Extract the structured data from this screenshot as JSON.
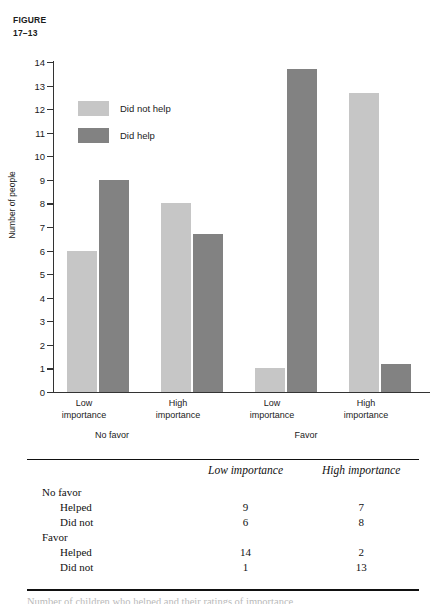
{
  "figure": {
    "label_line1": "FIGURE",
    "label_line2": "17–13"
  },
  "chart_data": {
    "type": "bar",
    "title": "",
    "xlabel": "",
    "ylabel": "Number of people",
    "ylim": [
      0,
      14
    ],
    "ytick_labels": [
      "0",
      "1",
      "2",
      "3",
      "4",
      "5",
      "6",
      "7",
      "8",
      "9",
      "10",
      "11",
      "12",
      "13",
      "14"
    ],
    "yticks": [
      0,
      1,
      2,
      3,
      4,
      5,
      6,
      7,
      8,
      9,
      10,
      11,
      12,
      13,
      14
    ],
    "grid": false,
    "legend_position": "upper-left-inside",
    "categories": [
      "Low importance",
      "High importance",
      "Low importance",
      "High importance"
    ],
    "group_labels": [
      "No favor",
      "Favor"
    ],
    "series": [
      {
        "name": "Did not help",
        "color": "#c6c6c6",
        "values": [
          6,
          8,
          1,
          12.7
        ]
      },
      {
        "name": "Did help",
        "color": "#828282",
        "values": [
          9,
          6.7,
          13.7,
          1.2
        ]
      }
    ]
  },
  "legend": {
    "items": [
      {
        "label": "Did not help",
        "swatch": "light-gray-swatch-icon"
      },
      {
        "label": "Did help",
        "swatch": "dark-gray-swatch-icon"
      }
    ]
  },
  "axis": {
    "y_label": "Number of people",
    "ticks": [
      "14",
      "13",
      "12",
      "11",
      "10",
      "9",
      "8",
      "7",
      "6",
      "5",
      "4",
      "3",
      "2",
      "1",
      "0"
    ]
  },
  "x_axis": {
    "categories": [
      {
        "line1": "Low",
        "line2": "importance"
      },
      {
        "line1": "High",
        "line2": "importance"
      },
      {
        "line1": "Low",
        "line2": "importance"
      },
      {
        "line1": "High",
        "line2": "importance"
      }
    ],
    "groups": [
      "No favor",
      "Favor"
    ]
  },
  "table": {
    "header": {
      "corner": "",
      "col1": "Low importance",
      "col2": "High importance"
    },
    "rows": [
      {
        "label": "No favor",
        "indent": false,
        "col1": "",
        "col2": ""
      },
      {
        "label": "Helped",
        "indent": true,
        "col1": "9",
        "col2": "7"
      },
      {
        "label": "Did not",
        "indent": true,
        "col1": "6",
        "col2": "8"
      },
      {
        "label": "Favor",
        "indent": false,
        "col1": "",
        "col2": ""
      },
      {
        "label": "Helped",
        "indent": true,
        "col1": "14",
        "col2": "2"
      },
      {
        "label": "Did not",
        "indent": true,
        "col1": "1",
        "col2": "13"
      }
    ]
  },
  "clipped_caption": "Number of children who helped and their ratings of importance"
}
